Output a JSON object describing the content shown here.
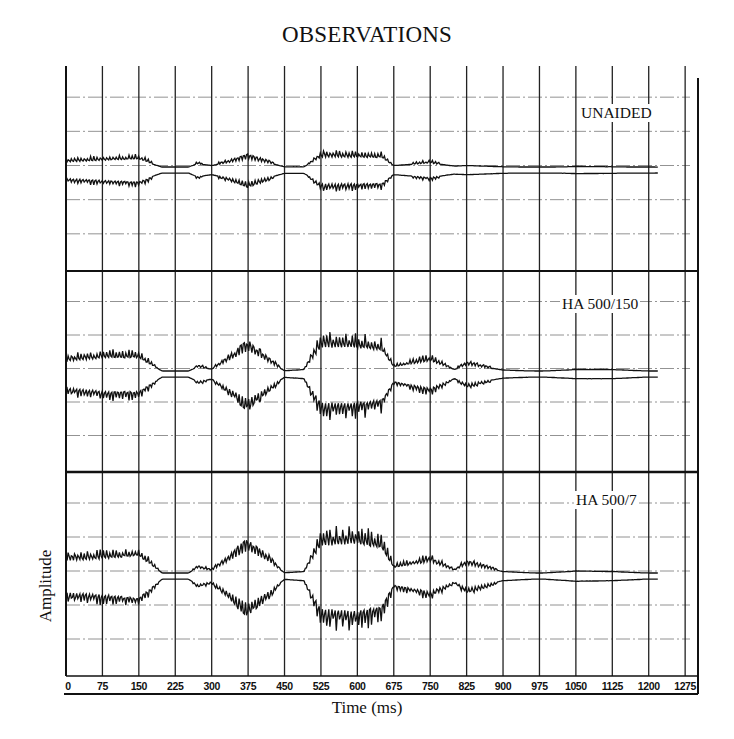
{
  "chart": {
    "title": "OBSERVATIONS",
    "xlabel": "Time (ms)",
    "ylabel": "Amplitude"
  },
  "chart_data": {
    "type": "line",
    "title": "OBSERVATIONS",
    "xlabel": "Time (ms)",
    "ylabel": "Amplitude",
    "x_ticks": [
      0,
      75,
      150,
      225,
      300,
      375,
      450,
      525,
      600,
      675,
      750,
      825,
      900,
      975,
      1050,
      1125,
      1200,
      1275
    ],
    "xlim": [
      0,
      1290
    ],
    "grid": true,
    "legend_position": "panel-top-right",
    "panels": [
      {
        "name": "UNAIDED",
        "description": "Amplitude envelope of speech waveform (symmetric about baseline), relative units",
        "envelope": [
          {
            "t": 0,
            "a": 0.25
          },
          {
            "t": 75,
            "a": 0.3
          },
          {
            "t": 150,
            "a": 0.35
          },
          {
            "t": 200,
            "a": 0.02
          },
          {
            "t": 250,
            "a": 0.02
          },
          {
            "t": 270,
            "a": 0.18
          },
          {
            "t": 300,
            "a": 0.1
          },
          {
            "t": 375,
            "a": 0.38
          },
          {
            "t": 420,
            "a": 0.2
          },
          {
            "t": 450,
            "a": 0.05
          },
          {
            "t": 490,
            "a": 0.05
          },
          {
            "t": 525,
            "a": 0.45
          },
          {
            "t": 600,
            "a": 0.42
          },
          {
            "t": 650,
            "a": 0.4
          },
          {
            "t": 675,
            "a": 0.1
          },
          {
            "t": 750,
            "a": 0.2
          },
          {
            "t": 800,
            "a": 0.08
          },
          {
            "t": 825,
            "a": 0.1
          },
          {
            "t": 900,
            "a": 0.05
          },
          {
            "t": 975,
            "a": 0.02
          },
          {
            "t": 1050,
            "a": 0.06
          },
          {
            "t": 1125,
            "a": 0.05
          },
          {
            "t": 1220,
            "a": 0.01
          }
        ]
      },
      {
        "name": "HA 500/150",
        "description": "Amplitude envelope with hearing aid setting 500/150, relative units",
        "envelope": [
          {
            "t": 0,
            "a": 0.45
          },
          {
            "t": 75,
            "a": 0.55
          },
          {
            "t": 150,
            "a": 0.55
          },
          {
            "t": 200,
            "a": 0.02
          },
          {
            "t": 250,
            "a": 0.02
          },
          {
            "t": 270,
            "a": 0.2
          },
          {
            "t": 300,
            "a": 0.12
          },
          {
            "t": 375,
            "a": 0.9
          },
          {
            "t": 420,
            "a": 0.4
          },
          {
            "t": 450,
            "a": 0.05
          },
          {
            "t": 490,
            "a": 0.1
          },
          {
            "t": 525,
            "a": 1.0
          },
          {
            "t": 600,
            "a": 0.95
          },
          {
            "t": 650,
            "a": 0.85
          },
          {
            "t": 675,
            "a": 0.2
          },
          {
            "t": 750,
            "a": 0.45
          },
          {
            "t": 800,
            "a": 0.1
          },
          {
            "t": 825,
            "a": 0.3
          },
          {
            "t": 900,
            "a": 0.08
          },
          {
            "t": 975,
            "a": 0.03
          },
          {
            "t": 1050,
            "a": 0.1
          },
          {
            "t": 1125,
            "a": 0.1
          },
          {
            "t": 1220,
            "a": 0.02
          }
        ]
      },
      {
        "name": "HA 500/7",
        "description": "Amplitude envelope with hearing aid setting 500/7, relative units",
        "envelope": [
          {
            "t": 0,
            "a": 0.55
          },
          {
            "t": 75,
            "a": 0.6
          },
          {
            "t": 150,
            "a": 0.7
          },
          {
            "t": 200,
            "a": 0.02
          },
          {
            "t": 250,
            "a": 0.02
          },
          {
            "t": 270,
            "a": 0.25
          },
          {
            "t": 300,
            "a": 0.15
          },
          {
            "t": 375,
            "a": 1.0
          },
          {
            "t": 420,
            "a": 0.5
          },
          {
            "t": 450,
            "a": 0.05
          },
          {
            "t": 490,
            "a": 0.1
          },
          {
            "t": 525,
            "a": 1.15
          },
          {
            "t": 600,
            "a": 1.2
          },
          {
            "t": 650,
            "a": 1.0
          },
          {
            "t": 675,
            "a": 0.25
          },
          {
            "t": 750,
            "a": 0.5
          },
          {
            "t": 800,
            "a": 0.15
          },
          {
            "t": 825,
            "a": 0.4
          },
          {
            "t": 900,
            "a": 0.1
          },
          {
            "t": 975,
            "a": 0.03
          },
          {
            "t": 1050,
            "a": 0.12
          },
          {
            "t": 1125,
            "a": 0.1
          },
          {
            "t": 1220,
            "a": 0.02
          }
        ]
      }
    ]
  },
  "panels": {
    "0": {
      "label": "UNAIDED"
    },
    "1": {
      "label": "HA 500/150"
    },
    "2": {
      "label": "HA 500/7"
    }
  },
  "xticks": [
    "0",
    "75",
    "150",
    "225",
    "300",
    "375",
    "450",
    "525",
    "600",
    "675",
    "750",
    "825",
    "900",
    "975",
    "1050",
    "1125",
    "1200",
    "1275"
  ]
}
